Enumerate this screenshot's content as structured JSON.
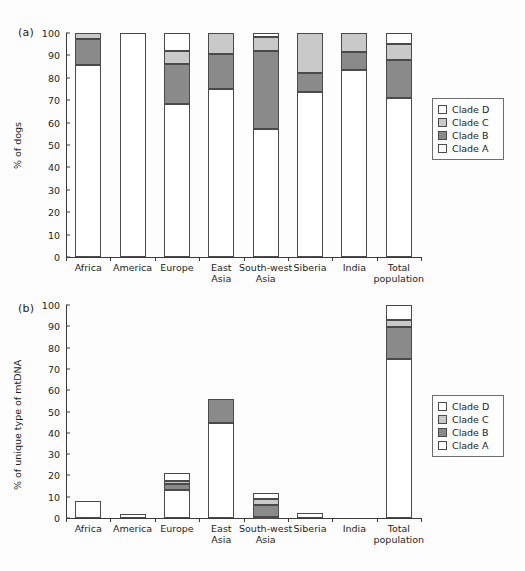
{
  "figure": {
    "background": "#fdfdfd",
    "panels": [
      "(a)",
      "(b)"
    ]
  },
  "panel_a": {
    "label": "(a)",
    "ylabel": "% of dogs"
  },
  "panel_b": {
    "label": "(b)",
    "ylabel": "% of unique type of mtDNA"
  },
  "legend": {
    "items": [
      {
        "label": "Clade D",
        "color": "#ffffff"
      },
      {
        "label": "Clade C",
        "color": "#c9c9c9"
      },
      {
        "label": "Clade B",
        "color": "#8a8a8a"
      },
      {
        "label": "Clade A",
        "color": "#ffffff"
      }
    ]
  },
  "colors": {
    "clade_a": "#ffffff",
    "clade_b": "#8a8a8a",
    "clade_c": "#c9c9c9",
    "clade_d": "#ffffff",
    "outline": "#4a4a4a",
    "axis": "#3a3a3a",
    "text": "#1d1d1d"
  },
  "chart_data": [
    {
      "type": "bar",
      "stacked": true,
      "panel": "(a)",
      "title": "",
      "xlabel": "",
      "ylabel": "% of dogs",
      "ylim": [
        0,
        100
      ],
      "yticks": [
        0,
        10,
        20,
        30,
        40,
        50,
        60,
        70,
        80,
        90,
        100
      ],
      "ytick_labels": [
        "0",
        "10",
        "20",
        "30",
        "40",
        "50",
        "60",
        "70",
        "80",
        "90",
        "100"
      ],
      "grid": false,
      "legend_position": "right",
      "categories": [
        "Africa",
        "America",
        "Europe",
        "East\nAsia",
        "South-west\nAsia",
        "Siberia",
        "India",
        "Total\npopulation"
      ],
      "series": [
        {
          "name": "Clade A",
          "color": "#ffffff",
          "values": [
            85.5,
            100.0,
            68.5,
            75.0,
            57.0,
            73.5,
            83.5,
            71.0
          ]
        },
        {
          "name": "Clade B",
          "color": "#8a8a8a",
          "values": [
            12.0,
            0.0,
            17.5,
            15.5,
            35.0,
            8.5,
            8.0,
            17.0
          ]
        },
        {
          "name": "Clade C",
          "color": "#c9c9c9",
          "values": [
            2.5,
            0.0,
            6.0,
            9.5,
            6.0,
            18.0,
            8.5,
            7.0
          ]
        },
        {
          "name": "Clade D",
          "color": "#ffffff",
          "values": [
            0.0,
            0.0,
            8.0,
            0.0,
            2.0,
            0.0,
            0.0,
            5.0
          ]
        }
      ]
    },
    {
      "type": "bar",
      "stacked": true,
      "panel": "(b)",
      "title": "",
      "xlabel": "",
      "ylabel": "% of unique type of mtDNA",
      "ylim": [
        0,
        100
      ],
      "yticks": [
        0,
        10,
        20,
        30,
        40,
        50,
        60,
        70,
        80,
        90,
        100
      ],
      "ytick_labels": [
        "0",
        "10",
        "20",
        "30",
        "40",
        "50",
        "60",
        "70",
        "80",
        "90",
        "100"
      ],
      "grid": false,
      "legend_position": "right",
      "categories": [
        "Africa",
        "America",
        "Europe",
        "East\nAsia",
        "South-west\nAsia",
        "Siberia",
        "India",
        "Total\npopulation"
      ],
      "series": [
        {
          "name": "Clade A",
          "color": "#ffffff",
          "values": [
            8.0,
            1.8,
            13.0,
            44.8,
            0.6,
            2.2,
            0.0,
            74.5
          ]
        },
        {
          "name": "Clade B",
          "color": "#8a8a8a",
          "values": [
            0.0,
            0.0,
            3.0,
            11.0,
            5.6,
            0.0,
            0.0,
            15.0
          ]
        },
        {
          "name": "Clade C",
          "color": "#c9c9c9",
          "values": [
            0.0,
            0.0,
            1.2,
            0.0,
            2.8,
            0.0,
            0.0,
            3.5
          ]
        },
        {
          "name": "Clade D",
          "color": "#ffffff",
          "values": [
            0.0,
            0.0,
            3.8,
            0.0,
            2.9,
            0.0,
            0.0,
            7.0
          ]
        }
      ]
    }
  ]
}
